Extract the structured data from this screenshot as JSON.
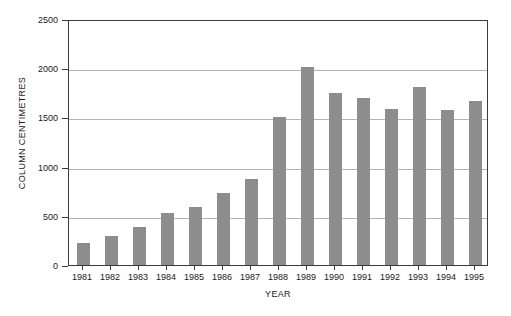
{
  "chart_data": {
    "type": "bar",
    "title": "",
    "xlabel": "YEAR",
    "ylabel": "COLUMN CENTIMETRES",
    "categories": [
      "1981",
      "1982",
      "1983",
      "1984",
      "1985",
      "1986",
      "1987",
      "1988",
      "1989",
      "1990",
      "1991",
      "1992",
      "1993",
      "1994",
      "1995"
    ],
    "values": [
      225,
      295,
      390,
      525,
      590,
      730,
      870,
      1500,
      2010,
      1750,
      1700,
      1590,
      1810,
      1580,
      1665
    ],
    "ylim": [
      0,
      2500
    ],
    "yticks": [
      0,
      500,
      1000,
      1500,
      2000,
      2500
    ],
    "ytick_labels": [
      "0",
      "500",
      "1000",
      "1500",
      "2000",
      "2500"
    ],
    "grid": "horizontal",
    "legend": "none",
    "bar_color": "#8d8d8d",
    "axis_color": "#3a3a3a",
    "gridline_color": "#b4b4b4",
    "background_color": "#ffffff"
  }
}
